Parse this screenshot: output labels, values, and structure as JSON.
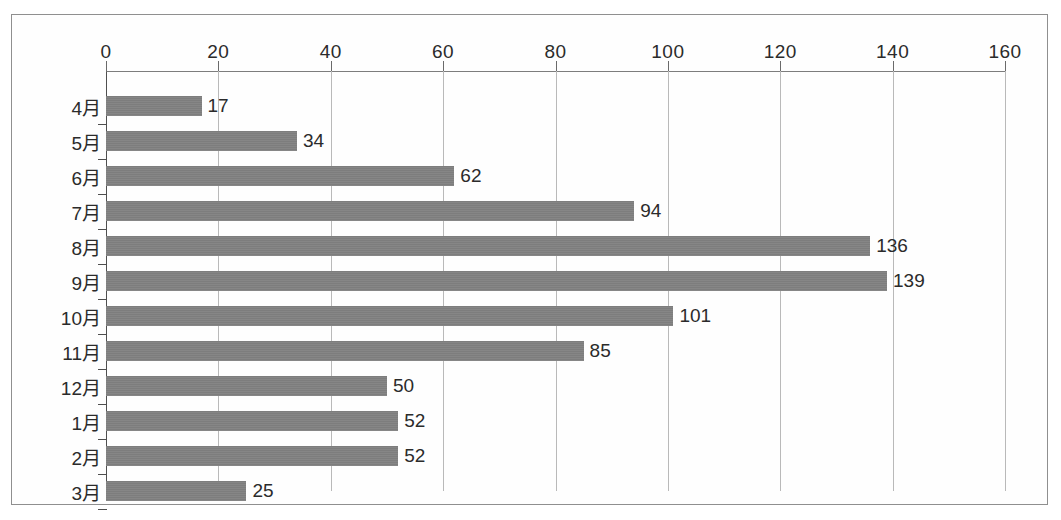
{
  "chart_data": {
    "type": "bar",
    "orientation": "horizontal",
    "title": "",
    "subtitle": "",
    "xlabel": "",
    "ylabel": "",
    "categories": [
      "4月",
      "5月",
      "6月",
      "7月",
      "8月",
      "9月",
      "10月",
      "11月",
      "12月",
      "1月",
      "2月",
      "3月"
    ],
    "values": [
      17,
      34,
      62,
      94,
      136,
      139,
      101,
      85,
      50,
      52,
      52,
      25
    ],
    "data_labels": [
      "17",
      "34",
      "62",
      "94",
      "136",
      "139",
      "101",
      "85",
      "50",
      "52",
      "52",
      "25"
    ],
    "xlim": [
      0,
      160
    ],
    "xticks": [
      0,
      20,
      40,
      60,
      80,
      100,
      120,
      140,
      160
    ],
    "xtick_labels": [
      "0",
      "20",
      "40",
      "60",
      "80",
      "100",
      "120",
      "140",
      "160"
    ],
    "grid": true,
    "grid_axis": "x",
    "legend": false,
    "legend_position": "none",
    "bar_color": "#7f7f7f",
    "axis_color": "#4f4f4f",
    "grid_color": "#b9b9b9",
    "label_color": "#2b2b2b",
    "background_color": "#fefefe",
    "border_color": "#8f8f8f",
    "value_label_position": "outside-end",
    "axis_position": "top"
  }
}
